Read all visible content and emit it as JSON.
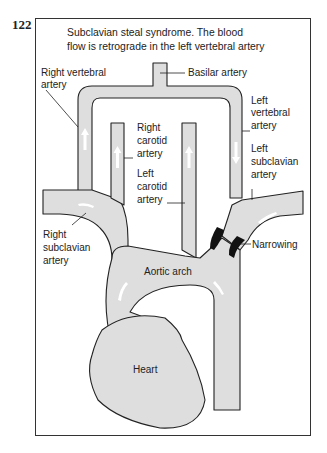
{
  "figure": {
    "number": "122",
    "title_line1": "Subclavian steal syndrome. The blood",
    "title_line2": "flow is retrograde in the left vertebral artery"
  },
  "labels": {
    "right_vertebral": [
      "Right vertebral",
      "artery"
    ],
    "basilar": "Basilar artery",
    "left_vertebral": [
      "Left",
      "vertebral",
      "artery"
    ],
    "right_carotid": [
      "Right",
      "carotid",
      "artery"
    ],
    "left_carotid": [
      "Left",
      "carotid",
      "artery"
    ],
    "left_subclavian": [
      "Left",
      "subclavian",
      "artery"
    ],
    "narrowing": "Narrowing",
    "right_subclavian": [
      "Right",
      "subclavian",
      "artery"
    ],
    "aortic_arch": "Aortic arch",
    "heart": "Heart"
  },
  "colors": {
    "vessel_fill": "#dedede",
    "outline": "#222222",
    "stenosis": "#111111",
    "flow_arrow": "#ffffff"
  }
}
